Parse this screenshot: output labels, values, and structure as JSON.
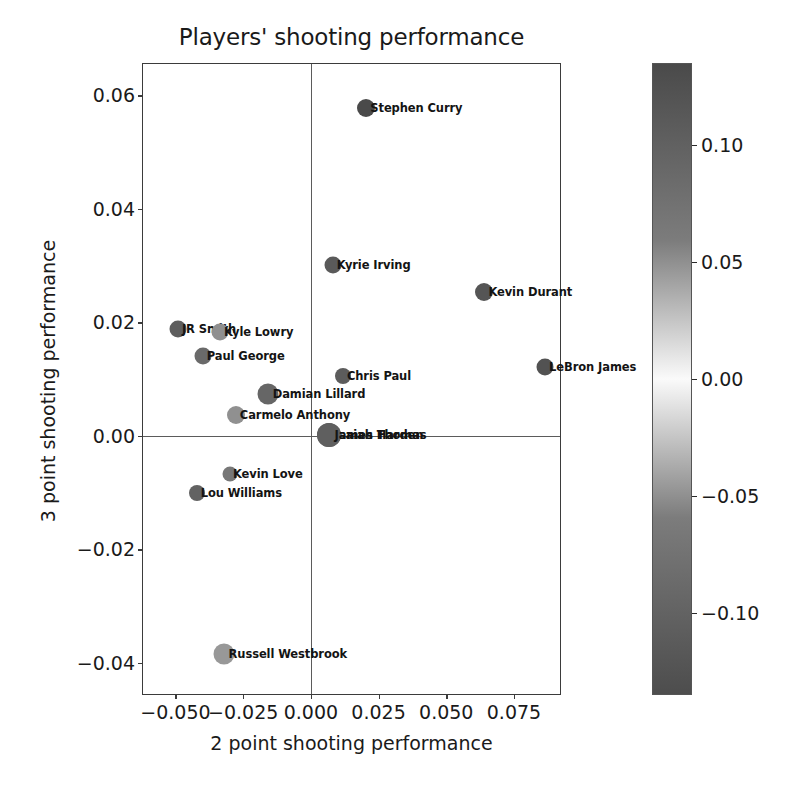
{
  "chart_data": {
    "type": "scatter",
    "title": "Players' shooting performance",
    "xlabel": "2 point shooting performance",
    "ylabel": "3 point shooting performance",
    "xlim": [
      -0.062,
      0.092
    ],
    "ylim": [
      -0.0455,
      0.0655
    ],
    "grid": false,
    "legend": "none",
    "xticks": [
      -0.05,
      -0.025,
      0.0,
      0.025,
      0.05,
      0.075
    ],
    "xticklabels": [
      "−0.050",
      "−0.025",
      "0.000",
      "0.025",
      "0.050",
      "0.075"
    ],
    "yticks": [
      -0.04,
      -0.02,
      0.0,
      0.02,
      0.04,
      0.06
    ],
    "yticklabels": [
      "−0.04",
      "−0.02",
      "0.00",
      "0.02",
      "0.04",
      "0.06"
    ],
    "reference_lines": {
      "vertical_x": 0.0,
      "horizontal_y": 0.0
    },
    "colorbar": {
      "label": "",
      "ticks": [
        -0.1,
        -0.05,
        0.0,
        0.05,
        0.1
      ],
      "ticklabels": [
        "−0.10",
        "−0.05",
        "0.00",
        "0.05",
        "0.10"
      ],
      "vmin": -0.135,
      "vmax": 0.135,
      "colormap": "gray-diverging",
      "low_color": "#4d4d4d",
      "mid_color": "#fafafa",
      "high_color": "#4a4a4a"
    },
    "points": [
      {
        "label": "Stephen Curry",
        "x": 0.0205,
        "y": 0.0578,
        "c": 0.118,
        "size": 18,
        "color": "#4a4a4a"
      },
      {
        "label": "Kyrie Irving",
        "x": 0.0082,
        "y": 0.0301,
        "c": 0.085,
        "size": 17,
        "color": "#5a5a5a"
      },
      {
        "label": "Kevin Durant",
        "x": 0.0641,
        "y": 0.0253,
        "c": 0.095,
        "size": 18,
        "color": "#555555"
      },
      {
        "label": "JR Smith",
        "x": -0.049,
        "y": 0.0188,
        "c": -0.075,
        "size": 17,
        "color": "#5e5e5e"
      },
      {
        "label": "Kyle Lowry",
        "x": -0.0335,
        "y": 0.0183,
        "c": -0.03,
        "size": 17,
        "color": "#8f8f8f"
      },
      {
        "label": "Paul George",
        "x": -0.0398,
        "y": 0.0141,
        "c": -0.06,
        "size": 17,
        "color": "#6a6a6a"
      },
      {
        "label": "LeBron James",
        "x": 0.0866,
        "y": 0.0121,
        "c": 0.098,
        "size": 17,
        "color": "#525252"
      },
      {
        "label": "Chris Paul",
        "x": 0.012,
        "y": 0.0105,
        "c": 0.078,
        "size": 16,
        "color": "#5c5c5c"
      },
      {
        "label": "Damian Lillard",
        "x": -0.0158,
        "y": 0.0073,
        "c": 0.04,
        "size": 21,
        "color": "#666666"
      },
      {
        "label": "Carmelo Anthony",
        "x": -0.0277,
        "y": 0.0036,
        "c": -0.028,
        "size": 18,
        "color": "#909090"
      },
      {
        "label": "Isaiah Thomas",
        "x": 0.0068,
        "y": 0.0002,
        "c": 0.055,
        "size": 24,
        "color": "#5f5f5f"
      },
      {
        "label": "James Harden",
        "x": 0.0068,
        "y": 0.0002,
        "c": 0.055,
        "size": 24,
        "color": "#5f5f5f"
      },
      {
        "label": "Kevin Love",
        "x": -0.03,
        "y": -0.0068,
        "c": -0.045,
        "size": 15,
        "color": "#777777"
      },
      {
        "label": "Lou Williams",
        "x": -0.042,
        "y": -0.0101,
        "c": -0.07,
        "size": 16,
        "color": "#626262"
      },
      {
        "label": "Russell Westbrook",
        "x": -0.0321,
        "y": -0.0385,
        "c": -0.02,
        "size": 21,
        "color": "#989898"
      }
    ]
  }
}
